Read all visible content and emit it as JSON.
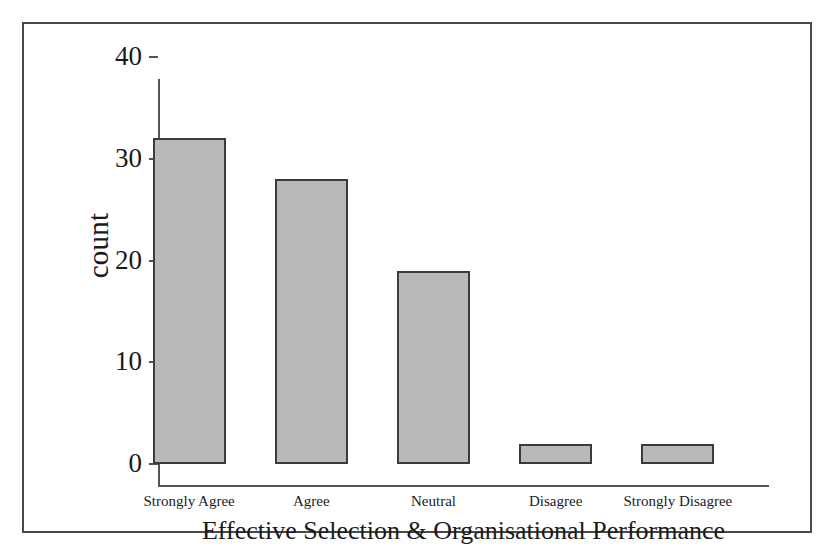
{
  "figure": {
    "background_color": "#ffffff",
    "frame_color": "#4a4a4a",
    "bar_fill_color": "#b9b9b9",
    "bar_edge_color": "#3b3b3b",
    "axis_color": "#555555"
  },
  "chart_data": {
    "type": "bar",
    "title": "",
    "xlabel": "Effective Selection & Organisational Performance",
    "ylabel": "count",
    "categories": [
      "Strongly Agree",
      "Agree",
      "Neutral",
      "Disagree",
      "Strongly Disagree"
    ],
    "values": [
      32,
      28,
      19,
      2,
      2
    ],
    "ylim": [
      0,
      40
    ],
    "yticks": [
      0,
      10,
      20,
      30,
      40
    ],
    "ytick_labels": [
      "0",
      "10",
      "20",
      "30",
      "40"
    ],
    "grid": false,
    "legend": false,
    "legend_position": "none"
  }
}
